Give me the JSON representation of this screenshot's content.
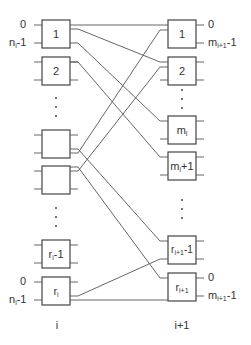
{
  "diagram": {
    "left_column": {
      "label": "i",
      "boxes": [
        {
          "id": "L1",
          "label": "1"
        },
        {
          "id": "L2",
          "label": "2"
        },
        {
          "id": "L3",
          "label": ""
        },
        {
          "id": "L4",
          "label": ""
        },
        {
          "id": "L5",
          "label": "r",
          "sub": "i",
          "suffix": "-1"
        },
        {
          "id": "L6",
          "label": "r",
          "sub": "i",
          "suffix": ""
        }
      ],
      "port_labels": {
        "top_zero": "0",
        "top_n": "n",
        "top_n_sub": "i",
        "top_n_suffix": "-1",
        "bottom_zero": "0",
        "bottom_n": "n",
        "bottom_n_sub": "i",
        "bottom_n_suffix": "-1"
      }
    },
    "right_column": {
      "label": "i+1",
      "boxes": [
        {
          "id": "R1",
          "label": "1"
        },
        {
          "id": "R2",
          "label": "2"
        },
        {
          "id": "R3",
          "label": "m",
          "sub": "i",
          "suffix": ""
        },
        {
          "id": "R4",
          "label": "m",
          "sub": "i",
          "suffix": "+1"
        },
        {
          "id": "R5",
          "label": "r",
          "sub": "i+1",
          "suffix": "-1"
        },
        {
          "id": "R6",
          "label": "r",
          "sub": "i+1",
          "suffix": ""
        }
      ],
      "port_labels": {
        "top_zero": "0",
        "top_m": "m",
        "top_m_sub": "i+1",
        "top_m_suffix": "-1",
        "bottom_zero": "0",
        "bottom_m": "m",
        "bottom_m_sub": "i+1",
        "bottom_m_suffix": "-1"
      }
    },
    "colors": {
      "stroke": "#444444",
      "wire": "#555555",
      "text": "#333333"
    }
  }
}
